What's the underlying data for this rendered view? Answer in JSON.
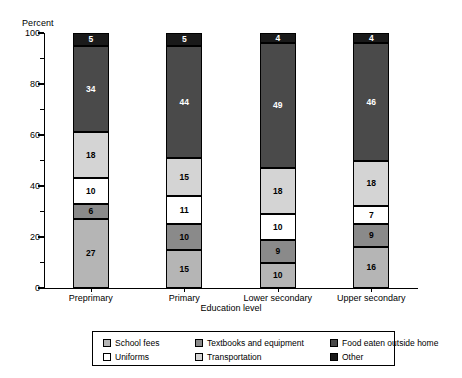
{
  "chart_data": {
    "type": "bar",
    "subtype": "stacked-bar",
    "title": "",
    "xlabel": "Education level",
    "ylabel": "Percent",
    "ylim": [
      0,
      100
    ],
    "yticks": [
      0,
      20,
      40,
      60,
      80,
      100
    ],
    "yminorticks": [
      10,
      30,
      50,
      70,
      90
    ],
    "grid": false,
    "legend_position": "bottom",
    "stack_order": "bottom-to-top",
    "categories": [
      "Preprimary",
      "Primary",
      "Lower secondary",
      "Upper secondary"
    ],
    "series": [
      {
        "name": "School fees",
        "color": "#b5b5b5",
        "values": [
          27,
          15,
          10,
          16
        ]
      },
      {
        "name": "Textbooks and equipment",
        "color": "#8a8a8a",
        "values": [
          6,
          10,
          9,
          9
        ]
      },
      {
        "name": "Uniforms",
        "color": "#ffffff",
        "values": [
          10,
          11,
          10,
          7
        ]
      },
      {
        "name": "Transportation",
        "color": "#d4d4d4",
        "values": [
          18,
          15,
          18,
          18
        ]
      },
      {
        "name": "Food eaten outside home",
        "color": "#4a4a4a",
        "values": [
          34,
          44,
          49,
          46
        ]
      },
      {
        "name": "Other",
        "color": "#1a1a1a",
        "values": [
          5,
          5,
          4,
          4
        ]
      }
    ],
    "totals": [
      100,
      100,
      100,
      100
    ]
  },
  "axis": {
    "y_title": "Percent",
    "x_title": "Education level",
    "y_tick_labels": [
      "0",
      "20",
      "40",
      "60",
      "80",
      "100"
    ],
    "x_tick_labels": [
      "Preprimary",
      "Primary",
      "Lower secondary",
      "Upper secondary"
    ]
  },
  "legend": {
    "items": [
      {
        "label": "School fees",
        "color": "#b5b5b5"
      },
      {
        "label": "Textbooks and equipment",
        "color": "#8a8a8a"
      },
      {
        "label": "Food eaten outside home",
        "color": "#4a4a4a"
      },
      {
        "label": "Uniforms",
        "color": "#ffffff"
      },
      {
        "label": "Transportation",
        "color": "#d4d4d4"
      },
      {
        "label": "Other",
        "color": "#1a1a1a"
      }
    ]
  }
}
